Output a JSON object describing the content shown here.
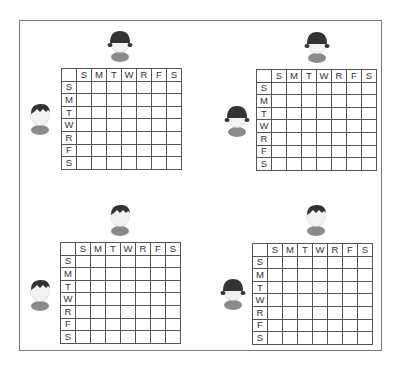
{
  "days": [
    "S",
    "M",
    "T",
    "W",
    "R",
    "F",
    "S"
  ],
  "panels": [
    {
      "id": "top-left",
      "top_person": "girl",
      "left_person": "boy",
      "grid": {
        "x": 61,
        "y": 68
      },
      "top_icon": {
        "x": 106,
        "y": 28
      },
      "left_icon": {
        "x": 26,
        "y": 101
      }
    },
    {
      "id": "top-right",
      "top_person": "girl",
      "left_person": "girl",
      "grid": {
        "x": 256,
        "y": 69
      },
      "top_icon": {
        "x": 303,
        "y": 29
      },
      "left_icon": {
        "x": 223,
        "y": 103
      }
    },
    {
      "id": "bottom-left",
      "top_person": "boy",
      "left_person": "boy",
      "grid": {
        "x": 60,
        "y": 242
      },
      "top_icon": {
        "x": 106,
        "y": 202
      },
      "left_icon": {
        "x": 26,
        "y": 277
      }
    },
    {
      "id": "bottom-right",
      "top_person": "boy",
      "left_person": "girl",
      "grid": {
        "x": 252,
        "y": 243
      },
      "top_icon": {
        "x": 302,
        "y": 202
      },
      "left_icon": {
        "x": 219,
        "y": 276
      }
    }
  ],
  "colors": {
    "hair": "#333333",
    "face": "#f2f2f2",
    "shirt": "#8a8a8a",
    "grid_line": "#555555"
  }
}
